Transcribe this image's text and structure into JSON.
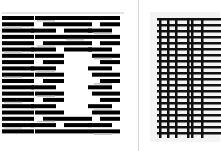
{
  "figure": {
    "left_panel": {
      "label": "",
      "pattern": "horizontal-bar-pattern-with-central-gap",
      "bar_color": "#000000",
      "gap_color": "#ffffff",
      "accent_color": "#c8c8c8"
    },
    "right_panel": {
      "label": "",
      "pattern": "grid-ladder-pattern",
      "bar_color": "#111111",
      "background_color": "#f4f4f4"
    },
    "divider_color": "#d8d8d8"
  }
}
